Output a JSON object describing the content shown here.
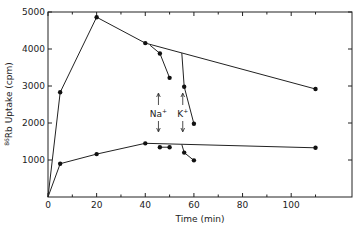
{
  "chart_data": {
    "type": "line",
    "title": "",
    "xlabel": "Time (min)",
    "ylabel": "86Rb Uptake (cpm)",
    "ylabel_superscript": "86",
    "ylabel_main": "Rb Uptake (cpm)",
    "xlim": [
      0,
      125
    ],
    "ylim": [
      0,
      5000
    ],
    "grid": false,
    "legend": null,
    "x_ticks": [
      0,
      20,
      40,
      60,
      80,
      100
    ],
    "x_minor_ticks": [
      10,
      30,
      50,
      70,
      90,
      110
    ],
    "y_ticks": [
      1000,
      2000,
      3000,
      4000,
      5000
    ],
    "y_tick_labels": [
      "1000",
      "2000",
      "3000",
      "4000",
      "5000"
    ],
    "x_tick_labels": [
      "0",
      "20",
      "40",
      "60",
      "80",
      "100"
    ],
    "series": [
      {
        "name": "upper control",
        "x": [
          0,
          5,
          20,
          40,
          110
        ],
        "y": [
          0,
          2830,
          4860,
          4160,
          2920
        ]
      },
      {
        "name": "upper Na+ addition",
        "x": [
          42,
          46,
          50
        ],
        "y": [
          4100,
          3880,
          3220
        ],
        "branch_from_line": true
      },
      {
        "name": "upper K+ addition",
        "x": [
          55,
          56,
          60
        ],
        "y": [
          3890,
          2980,
          1980
        ],
        "branch_from_line": true
      },
      {
        "name": "lower control",
        "x": [
          0,
          5,
          20,
          40,
          110
        ],
        "y": [
          0,
          900,
          1160,
          1450,
          1330
        ]
      },
      {
        "name": "lower Na+ addition",
        "x": [
          46,
          50
        ],
        "y": [
          1345,
          1345
        ]
      },
      {
        "name": "lower K+ addition",
        "x": [
          55,
          56,
          60
        ],
        "y": [
          1420,
          1200,
          990
        ],
        "branch_from_line": true
      }
    ],
    "annotations": [
      {
        "text": "Na+",
        "label": "Na",
        "sup": "+",
        "x": 45,
        "arrows": "up-down"
      },
      {
        "text": "K+",
        "label": "K",
        "sup": "+",
        "x": 55,
        "arrows": "up-down"
      }
    ]
  }
}
